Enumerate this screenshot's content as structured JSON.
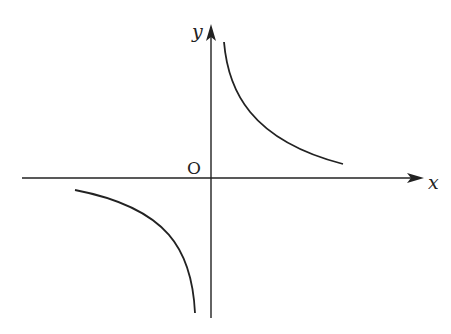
{
  "diagram": {
    "type": "coordinate-plane-hyperbola",
    "x_axis_label": "x",
    "y_axis_label": "y",
    "origin_label": "O",
    "curves": [
      {
        "name": "upper-right-branch",
        "quadrant": "I"
      },
      {
        "name": "lower-left-branch",
        "quadrant": "III"
      }
    ],
    "colors": {
      "stroke": "#222222",
      "background": "#ffffff"
    }
  }
}
